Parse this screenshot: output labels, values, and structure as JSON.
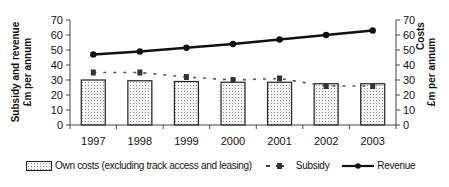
{
  "chart_data": {
    "type": "bar",
    "title": "",
    "xlabel": "",
    "ylabel": "Subsidy and revenue £m per annum",
    "y2label": "Costs £m per annum",
    "categories": [
      "1997",
      "1998",
      "1999",
      "2000",
      "2001",
      "2002",
      "2003"
    ],
    "ylim": [
      0,
      70
    ],
    "y2lim": [
      0,
      70
    ],
    "yticks": [
      0,
      10,
      20,
      30,
      40,
      50,
      60,
      70
    ],
    "grid": false,
    "legend_position": "bottom",
    "series": [
      {
        "name": "Own costs (excluding track access and leasing)",
        "type": "bar",
        "axis": "right",
        "values": [
          30,
          29.5,
          29,
          28.5,
          28.5,
          27.5,
          27.5
        ]
      },
      {
        "name": "Subsidy",
        "type": "line-dashed",
        "axis": "left",
        "values": [
          35,
          35,
          32,
          30,
          31,
          26,
          26
        ]
      },
      {
        "name": "Revenue",
        "type": "line",
        "axis": "left",
        "values": [
          47,
          49,
          51.5,
          54,
          57,
          60,
          63
        ]
      }
    ]
  },
  "axis": {
    "left_title_line1": "Subsidy and revenue",
    "left_title_line2": "£m per annum",
    "right_title_line1": "Costs",
    "right_title_line2": "£m per annum"
  },
  "legend": {
    "bars": "Own costs (excluding track access and leasing)",
    "subsidy": "Subsidy",
    "revenue": "Revenue"
  }
}
